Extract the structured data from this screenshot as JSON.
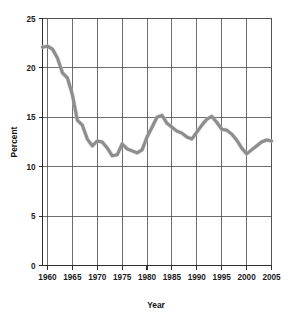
{
  "chart_data": {
    "type": "line",
    "title": "",
    "xlabel": "Year",
    "ylabel": "Percent",
    "xlim": [
      1959,
      2005
    ],
    "ylim": [
      0,
      25
    ],
    "grid": true,
    "legend": false,
    "line_color": "#8d8d8d",
    "x_ticks": [
      1960,
      1965,
      1970,
      1975,
      1980,
      1985,
      1990,
      1995,
      2000,
      2005
    ],
    "x_tick_labels": [
      "1960",
      "1965",
      "1970",
      "1975",
      "1980",
      "1985",
      "1990",
      "1995",
      "2000",
      "2005"
    ],
    "y_ticks": [
      0,
      5,
      10,
      15,
      20,
      25
    ],
    "y_tick_labels": [
      "0",
      "5",
      "10",
      "15",
      "20",
      "25"
    ],
    "series": [
      {
        "name": "Percent",
        "x": [
          1959,
          1960,
          1961,
          1962,
          1963,
          1964,
          1965,
          1966,
          1967,
          1968,
          1969,
          1970,
          1971,
          1972,
          1973,
          1974,
          1975,
          1976,
          1977,
          1978,
          1979,
          1980,
          1981,
          1982,
          1983,
          1984,
          1985,
          1986,
          1987,
          1988,
          1989,
          1990,
          1991,
          1992,
          1993,
          1994,
          1995,
          1996,
          1997,
          1998,
          1999,
          2000,
          2001,
          2002,
          2003,
          2004,
          2005
        ],
        "values": [
          22.1,
          22.2,
          21.9,
          21.0,
          19.5,
          19.0,
          17.3,
          14.7,
          14.2,
          12.8,
          12.1,
          12.6,
          12.5,
          11.9,
          11.1,
          11.2,
          12.3,
          11.8,
          11.6,
          11.4,
          11.7,
          13.0,
          14.0,
          15.0,
          15.2,
          14.4,
          14.0,
          13.6,
          13.4,
          13.0,
          12.8,
          13.5,
          14.2,
          14.8,
          15.1,
          14.5,
          13.8,
          13.7,
          13.3,
          12.7,
          11.9,
          11.3,
          11.7,
          12.1,
          12.5,
          12.7,
          12.6
        ]
      }
    ]
  }
}
